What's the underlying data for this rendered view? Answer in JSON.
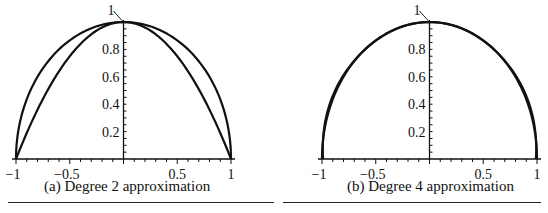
{
  "chart_data": [
    {
      "type": "line",
      "caption": "(a)  Degree 2 approximation",
      "xlim": [
        -1,
        1
      ],
      "ylim": [
        0,
        1
      ],
      "x_ticks": [
        -1,
        -0.5,
        0.5,
        1
      ],
      "x_tick_labels": [
        "−1",
        "−0.5",
        "0.5",
        "1"
      ],
      "y_ticks": [
        0.2,
        0.4,
        0.6,
        0.8,
        1
      ],
      "y_tick_labels": [
        "0.2",
        "0.4",
        "0.6",
        "0.8",
        "1"
      ],
      "grid": false,
      "series": [
        {
          "name": "unit semicircle",
          "kind": "circle"
        },
        {
          "name": "degree 2 approximation",
          "kind": "poly",
          "coeffs": [
            1,
            0,
            -1
          ]
        }
      ]
    },
    {
      "type": "line",
      "caption": "(b)  Degree 4 approximation",
      "xlim": [
        -1,
        1
      ],
      "ylim": [
        0,
        1
      ],
      "x_ticks": [
        -1,
        -0.5,
        0.5,
        1
      ],
      "x_tick_labels": [
        "−1",
        "−0.5",
        "0.5",
        "1"
      ],
      "y_ticks": [
        0.2,
        0.4,
        0.6,
        0.8,
        1
      ],
      "y_tick_labels": [
        "0.2",
        "0.4",
        "0.6",
        "0.8",
        "1"
      ],
      "grid": false,
      "series": [
        {
          "name": "unit semicircle",
          "kind": "circle"
        },
        {
          "name": "degree 4 approximation",
          "kind": "param4"
        }
      ]
    }
  ],
  "captions": {
    "a": "(a)  Degree 2 approximation",
    "b": "(b)  Degree 4 approximation"
  }
}
